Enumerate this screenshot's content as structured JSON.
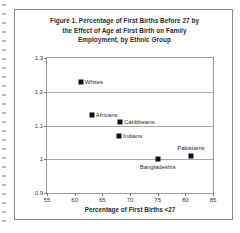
{
  "chart_data": {
    "type": "scatter",
    "title_lines": [
      "Figure 1. Percentage of First Births Before 27 by",
      "the Effect of Age at First Birth on Family",
      "Employment, by Ethnic Group"
    ],
    "xlabel": "Percentage of First Births <27",
    "ylabel": "",
    "xlim": [
      55,
      85
    ],
    "ylim": [
      0.9,
      1.3
    ],
    "xticks": [
      "55",
      "60",
      "65",
      "70",
      "75",
      "80",
      "85"
    ],
    "xtick_values": [
      55,
      60,
      65,
      70,
      75,
      80,
      85
    ],
    "yticks": [
      "0.9",
      "1",
      "1.1",
      "1.2",
      "1.3"
    ],
    "ytick_values": [
      0.9,
      1.0,
      1.1,
      1.2,
      1.3
    ],
    "grid": "horizontal",
    "legend": "none",
    "marker": "filled-square",
    "marker_color": "#111111",
    "points": [
      {
        "label": "Whites",
        "x": 61.1,
        "y": 1.23,
        "label_pos": "right"
      },
      {
        "label": "Africans",
        "x": 63.1,
        "y": 1.13,
        "label_pos": "right"
      },
      {
        "label": "Caribbeans",
        "x": 68.2,
        "y": 1.11,
        "label_pos": "right"
      },
      {
        "label": "Indians",
        "x": 68.0,
        "y": 1.07,
        "label_pos": "right"
      },
      {
        "label": "Bangladeshis",
        "x": 75.0,
        "y": 1.0,
        "label_pos": "below"
      },
      {
        "label": "Pakistanis",
        "x": 81.0,
        "y": 1.01,
        "label_pos": "above"
      }
    ]
  }
}
